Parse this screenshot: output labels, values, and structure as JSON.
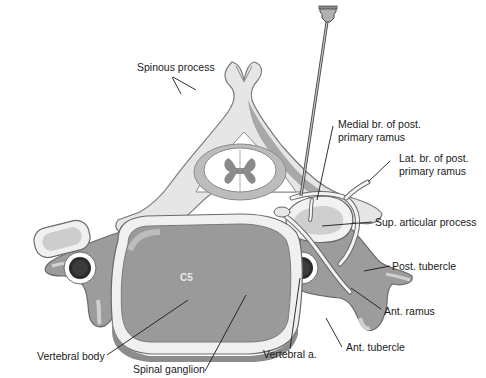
{
  "diagram": {
    "vertebra_label": "C5",
    "labels": {
      "spinous_process": "Spinous process",
      "medial_branch_line1": "Medial br. of post.",
      "medial_branch_line2": "primary ramus",
      "lateral_branch_line1": "Lat. br. of post.",
      "lateral_branch_line2": "primary ramus",
      "sup_articular_process": "Sup. articular process",
      "post_tubercle": "Post. tubercle",
      "ant_ramus": "Ant. ramus",
      "ant_tubercle": "Ant. tubercle",
      "vertebral_artery": "Vertebral a.",
      "spinal_ganglion": "Spinal ganglion",
      "vertebral_body": "Vertebral body"
    },
    "colors": {
      "bone_light": "#e6e6e6",
      "bone_mid": "#b4b4b4",
      "bone_dark": "#8e8e8e",
      "body_fill": "#9a9a9a",
      "artery_dark": "#2a2a2a",
      "outline": "#6a6a6a",
      "text": "#1a1a1a"
    }
  }
}
